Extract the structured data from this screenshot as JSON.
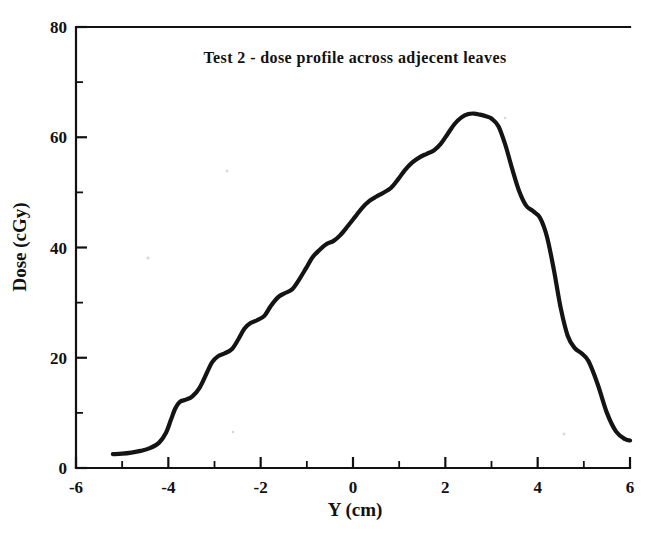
{
  "chart_data": {
    "type": "line",
    "title": "Test 2 - dose profile across adjecent leaves",
    "xlabel": "Y  (cm)",
    "ylabel": "Dose  (cGy)",
    "xlim": [
      -6,
      6
    ],
    "ylim": [
      0,
      80
    ],
    "grid": false,
    "legend": null,
    "x_major_ticks": [
      -6,
      -4,
      -2,
      0,
      2,
      4,
      6
    ],
    "x_major_tick_labels": [
      "-6",
      "-4",
      "-2",
      "0",
      "2",
      "4",
      "6"
    ],
    "x_minor_ticks": [
      -5,
      -3,
      -1,
      1,
      3,
      5
    ],
    "y_major_ticks": [
      0,
      20,
      40,
      60,
      80
    ],
    "y_major_tick_labels": [
      "0",
      "20",
      "40",
      "60",
      "80"
    ],
    "y_minor_ticks": [
      10,
      30,
      50,
      70
    ],
    "series": [
      {
        "name": "dose profile",
        "color": "#141414",
        "x": [
          -5.2,
          -5.0,
          -4.8,
          -4.6,
          -4.4,
          -4.2,
          -4.05,
          -3.95,
          -3.85,
          -3.75,
          -3.62,
          -3.48,
          -3.32,
          -3.18,
          -3.05,
          -2.92,
          -2.78,
          -2.62,
          -2.48,
          -2.35,
          -2.22,
          -2.08,
          -1.92,
          -1.78,
          -1.62,
          -1.48,
          -1.32,
          -1.18,
          -1.02,
          -0.88,
          -0.72,
          -0.58,
          -0.42,
          -0.28,
          -0.12,
          0.05,
          0.2,
          0.35,
          0.5,
          0.65,
          0.82,
          0.98,
          1.12,
          1.28,
          1.45,
          1.6,
          1.75,
          1.9,
          2.05,
          2.2,
          2.35,
          2.5,
          2.62,
          2.75,
          2.88,
          3.0,
          3.15,
          3.3,
          3.45,
          3.6,
          3.75,
          3.9,
          4.05,
          4.2,
          4.35,
          4.5,
          4.65,
          4.8,
          4.95,
          5.1,
          5.3,
          5.5,
          5.7,
          5.9,
          6.0
        ],
        "y": [
          2.5,
          2.6,
          2.8,
          3.1,
          3.6,
          4.6,
          6.4,
          8.6,
          10.8,
          12.0,
          12.4,
          13.0,
          14.6,
          17.0,
          19.2,
          20.3,
          20.8,
          21.6,
          23.4,
          25.3,
          26.3,
          26.8,
          27.6,
          29.4,
          31.0,
          31.7,
          32.4,
          34.0,
          36.2,
          38.2,
          39.6,
          40.6,
          41.2,
          42.2,
          43.8,
          45.6,
          47.2,
          48.4,
          49.2,
          49.9,
          50.8,
          52.4,
          54.0,
          55.4,
          56.4,
          57.0,
          57.6,
          58.8,
          60.6,
          62.4,
          63.6,
          64.2,
          64.3,
          64.1,
          63.8,
          63.4,
          62.0,
          58.6,
          54.2,
          50.2,
          47.6,
          46.6,
          45.4,
          42.0,
          36.0,
          29.0,
          24.0,
          21.8,
          20.8,
          19.4,
          15.2,
          10.0,
          6.6,
          5.2,
          5.0
        ]
      }
    ]
  }
}
